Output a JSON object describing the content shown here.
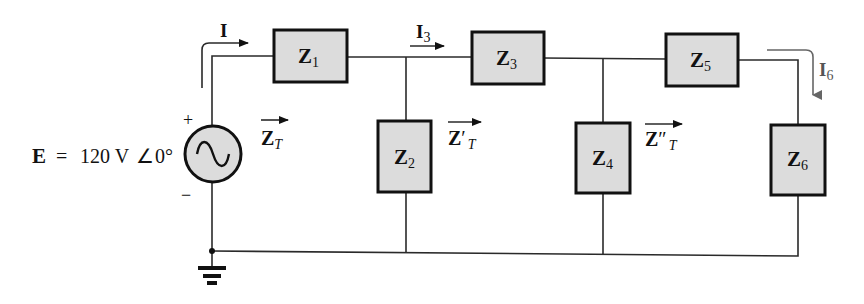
{
  "diagram": {
    "type": "ladder network circuit",
    "source": {
      "label": "E",
      "equals": "=",
      "value": "120 V",
      "angle_symbol": "∠",
      "angle": "0°",
      "plus": "+",
      "minus": "−"
    },
    "currents": [
      {
        "name": "I",
        "sub": ""
      },
      {
        "name": "I",
        "sub": "3"
      },
      {
        "name": "I",
        "sub": "6"
      }
    ],
    "impedances": [
      {
        "name": "Z",
        "sub": "1"
      },
      {
        "name": "Z",
        "sub": "2"
      },
      {
        "name": "Z",
        "sub": "3"
      },
      {
        "name": "Z",
        "sub": "4"
      },
      {
        "name": "Z",
        "sub": "5"
      },
      {
        "name": "Z",
        "sub": "6"
      }
    ],
    "equivalents": [
      {
        "name": "Z",
        "prime": "",
        "sub": "T"
      },
      {
        "name": "Z",
        "prime": "′",
        "sub": "T"
      },
      {
        "name": "Z",
        "prime": "″",
        "sub": "T"
      }
    ],
    "colors": {
      "box_fill": "#dcdcdc",
      "stroke": "#111111",
      "i6_arrow": "#666666"
    }
  }
}
